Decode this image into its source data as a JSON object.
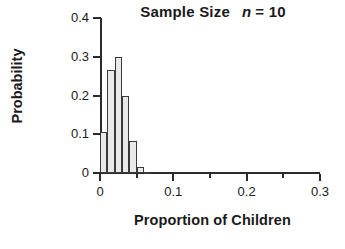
{
  "chart_data": {
    "type": "bar",
    "title_main": "Sample Size",
    "title_italic_var": "n",
    "title_equals": "= 10",
    "xlabel": "Proportion of Children",
    "ylabel": "Probability",
    "xlim": [
      0,
      0.3
    ],
    "ylim": [
      0,
      0.4
    ],
    "grid": false,
    "legend": "none",
    "bar_fill_color": "#e9e9e9",
    "bar_edge_color": "#3a3a3a",
    "axis_color": "#2b2b2b",
    "text_color": "#1a1a1a",
    "x_tick_labels": [
      "0",
      "0.1",
      "0.2",
      "0.3"
    ],
    "x_tick_values": [
      0,
      0.1,
      0.2,
      0.3
    ],
    "x_minor_tick_values": [
      0.05,
      0.15,
      0.25
    ],
    "y_tick_labels": [
      "0",
      "0.1",
      "0.2",
      "0.3",
      "0.4"
    ],
    "y_tick_values": [
      0,
      0.1,
      0.2,
      0.3,
      0.4
    ],
    "bin_width": 0.01,
    "categories": [
      "0.00",
      "0.01",
      "0.02",
      "0.03",
      "0.04",
      "0.05",
      "0.06"
    ],
    "x": [
      0.0,
      0.01,
      0.02,
      0.03,
      0.04,
      0.05,
      0.06
    ],
    "values": [
      0.105,
      0.265,
      0.3,
      0.2,
      0.082,
      0.015,
      0.003
    ]
  }
}
